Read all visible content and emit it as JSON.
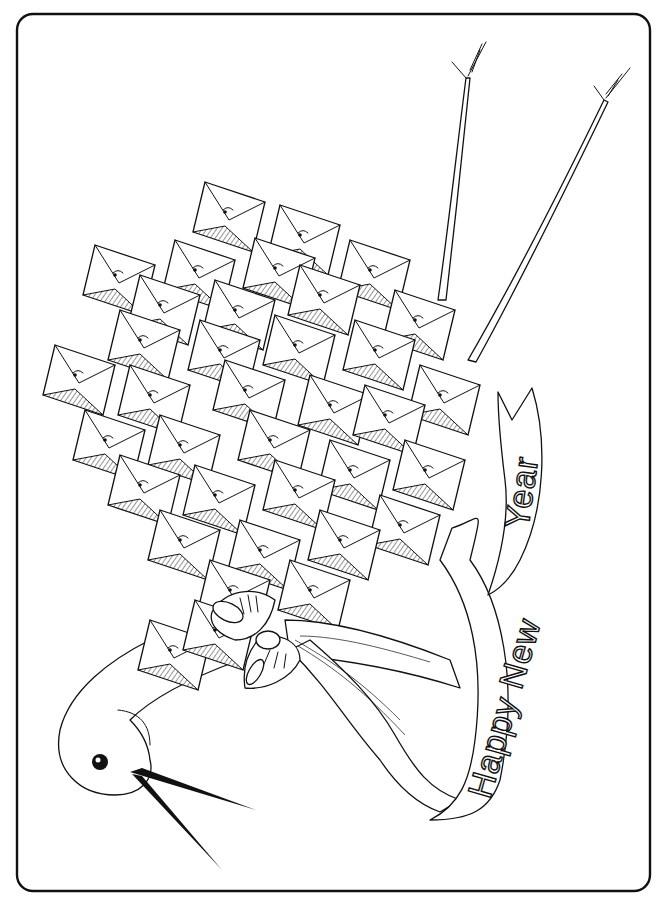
{
  "page": {
    "kind": "coloring-page",
    "background": "#ffffff",
    "line_color": "#111111"
  },
  "illustration": {
    "subject": "stork made of folded envelopes carrying a ribbon banner",
    "banner": {
      "line1": "Happy New",
      "line2": "Year"
    },
    "parts": [
      "border-frame",
      "legs",
      "envelope-body",
      "neck",
      "head",
      "eye",
      "beak",
      "bow",
      "ribbon",
      "banner"
    ]
  }
}
